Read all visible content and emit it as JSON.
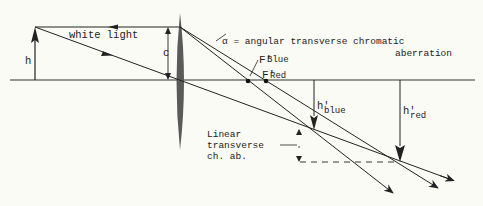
{
  "diagram": {
    "title": "Transverse chromatic aberration",
    "colors": {
      "background": "#fbfbf6",
      "ink": "#222222",
      "lens": "#555555"
    },
    "labels": {
      "white_light": "white light",
      "h": "h",
      "c": "c",
      "alpha_def_line1": "α = angular transverse chromatic",
      "alpha_def_line2": "aberration",
      "f_blue_main": "F'",
      "f_blue_sub": "Blue",
      "f_red_main": "F'",
      "f_red_sub": "Red",
      "h_blue_main": "h'",
      "h_blue_sub": "blue",
      "h_red_main": "h'",
      "h_red_sub": "red",
      "linear_line1": "Linear",
      "linear_line2": "transverse",
      "linear_line3": "ch. ab."
    },
    "elements": [
      "optical-axis",
      "object-arrow",
      "lens",
      "marginal-ray",
      "chief-ray",
      "blue-ray",
      "red-ray",
      "focal-point-blue",
      "focal-point-red",
      "image-height-blue",
      "image-height-red",
      "linear-aberration-marker"
    ]
  }
}
